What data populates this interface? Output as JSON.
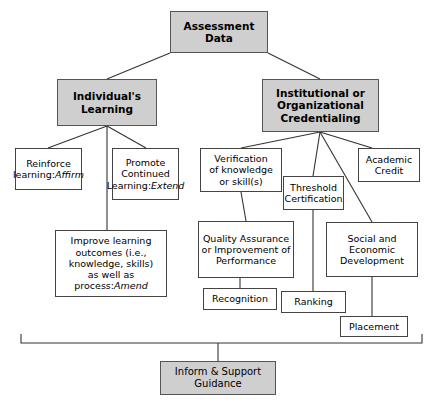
{
  "diagram": {
    "title_box": {
      "label": "Assessment\nData"
    },
    "branch_left": {
      "label": "Individual's\nLearning"
    },
    "branch_right": {
      "label": "Institutional or\nOrganizational\nCredentialing"
    },
    "bottom_box": {
      "label": "Inform & Support\nGuidance"
    },
    "left_nodes": [
      {
        "id": "reinforce",
        "label": "Reinforce\nlearning:",
        "emphasis": "Affirm"
      },
      {
        "id": "promote",
        "label": "Promote\nContinued\nLearning:",
        "emphasis": "Extend"
      },
      {
        "id": "improve",
        "label": "Improve learning\noutcomes (i.e.,\nknowledge, skills)\nas well as process:",
        "emphasis": "Amend"
      }
    ],
    "right_nodes": [
      {
        "id": "verification",
        "label": "Verification\nof knowledge\nor skill(s)",
        "emphasis": ""
      },
      {
        "id": "threshold",
        "label": "Threshold\nCertification",
        "emphasis": ""
      },
      {
        "id": "academic",
        "label": "Academic\nCredit",
        "emphasis": ""
      },
      {
        "id": "quality",
        "label": "Quality Assurance\nor Improvement of\nPerformance",
        "emphasis": ""
      },
      {
        "id": "social",
        "label": "Social and\nEconomic\nDevelopment",
        "emphasis": ""
      },
      {
        "id": "recognition",
        "label": "Recognition",
        "emphasis": ""
      },
      {
        "id": "ranking",
        "label": "Ranking",
        "emphasis": ""
      },
      {
        "id": "placement",
        "label": "Placement",
        "emphasis": ""
      }
    ],
    "colors": {
      "shaded_fill": "#cfcfcf",
      "box_stroke": "#444444",
      "line": "#333333",
      "text": "#000000",
      "background": "#ffffff"
    }
  }
}
